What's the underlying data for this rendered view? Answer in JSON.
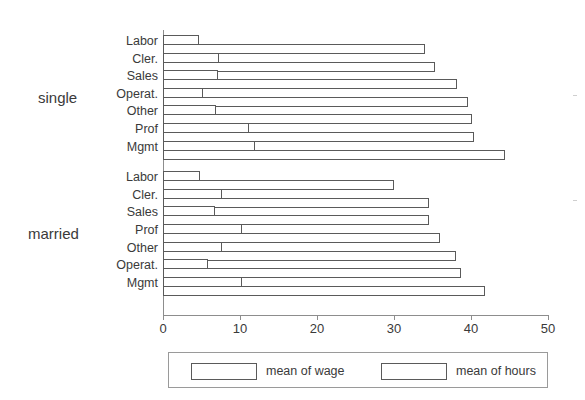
{
  "chart_data": {
    "type": "bar",
    "orientation": "horizontal",
    "title": "",
    "xlabel": "",
    "ylabel": "",
    "xlim": [
      0,
      50
    ],
    "xticks": [
      0,
      10,
      20,
      30,
      40,
      50
    ],
    "grid": false,
    "legend": {
      "position": "bottom",
      "entries": [
        {
          "name": "mean of wage"
        },
        {
          "name": "mean of hours"
        }
      ]
    },
    "groups": [
      {
        "name": "single",
        "categories": [
          "Labor",
          "Cler.",
          "Sales",
          "Operat.",
          "Other",
          "Prof",
          "Mgmt"
        ],
        "series": [
          {
            "name": "mean of wage",
            "values": [
              4.7,
              7.3,
              7.1,
              5.2,
              6.9,
              11.2,
              12.0
            ]
          },
          {
            "name": "mean of hours",
            "values": [
              34.0,
              35.3,
              38.2,
              39.6,
              40.1,
              40.4,
              44.4
            ]
          }
        ]
      },
      {
        "name": "married",
        "categories": [
          "Labor",
          "Cler.",
          "Sales",
          "Prof",
          "Other",
          "Operat.",
          "Mgmt"
        ],
        "series": [
          {
            "name": "mean of wage",
            "values": [
              4.8,
              7.7,
              6.8,
              10.2,
              7.6,
              5.8,
              10.3
            ]
          },
          {
            "name": "mean of hours",
            "values": [
              30.0,
              34.5,
              34.5,
              36.0,
              38.0,
              38.7,
              41.8
            ]
          }
        ]
      }
    ]
  },
  "legend": {
    "wage_label": "mean of wage",
    "hours_label": "mean of hours"
  },
  "axis": {
    "tick_labels": [
      "0",
      "10",
      "20",
      "30",
      "40",
      "50"
    ]
  },
  "groups": {
    "single_label": "single",
    "married_label": "married"
  }
}
